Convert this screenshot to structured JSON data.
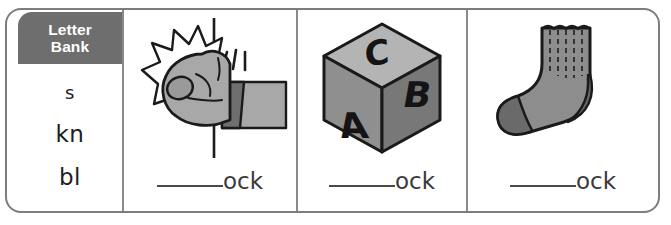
{
  "worksheet": {
    "letter_bank": {
      "title_line1": "Letter",
      "title_line2": "Bank",
      "header_color": "#6e6e6e",
      "options": [
        "s",
        "kn",
        "bl"
      ]
    },
    "cells": [
      {
        "picture_name": "knocking-fist-illustration",
        "picture_description": "A fist knocking on a door with impact starburst and motion lines",
        "answer_prefix_blank": "______",
        "answer_suffix": "ock"
      },
      {
        "picture_name": "abc-block-illustration",
        "picture_description": "A cube alphabet block showing letters A, B and C",
        "block_letters": {
          "left": "A",
          "right": "B",
          "top": "C"
        },
        "answer_prefix_blank": "______",
        "answer_suffix": "ock"
      },
      {
        "picture_name": "sock-illustration",
        "picture_description": "A grey ribbed crew sock with darker toe and heel",
        "answer_prefix_blank": "______",
        "answer_suffix": "ock"
      }
    ],
    "colors": {
      "border": "#7d7d7d",
      "divider": "#8a8a8a",
      "ink": "#1d1d1d",
      "art_fill_light": "#b0b0b0",
      "art_fill_mid": "#9a9a9a",
      "art_fill_dark": "#6f6f6f",
      "art_outline": "#1a1a1a",
      "answer_text": "#3a3a3a"
    }
  }
}
